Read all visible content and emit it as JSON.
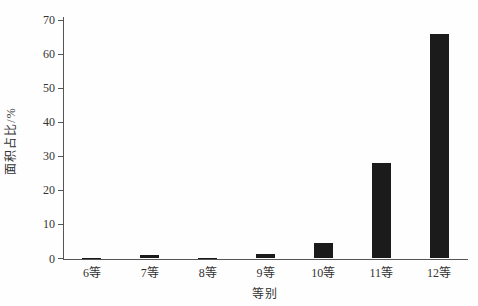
{
  "chart_data": {
    "type": "bar",
    "title": "",
    "categories": [
      "6等",
      "7等",
      "8等",
      "9等",
      "10等",
      "11等",
      "12等"
    ],
    "values": [
      0.05,
      1.0,
      0.2,
      1.3,
      4.6,
      28.0,
      66.0
    ],
    "xlabel": "等别",
    "ylabel": "面积占比/%",
    "ylim": [
      0,
      70
    ],
    "yticks": [
      0,
      10,
      20,
      30,
      40,
      50,
      60,
      70
    ],
    "legend_position": "none",
    "grid": "off",
    "bar_color": "#1b1b1b",
    "axis_color": "#555555",
    "text_color": "#333333",
    "background_color": "#fefefe"
  }
}
